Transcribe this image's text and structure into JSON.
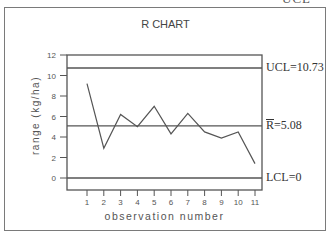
{
  "page": {
    "cut_text_top": "UCL"
  },
  "chart_data": {
    "type": "line",
    "title": "R CHART",
    "xlabel": "observation number",
    "ylabel": "range (kg/ha)",
    "x": [
      1,
      2,
      3,
      4,
      5,
      6,
      7,
      8,
      9,
      10,
      11
    ],
    "values": [
      9.2,
      2.9,
      6.2,
      5.0,
      7.0,
      4.3,
      6.3,
      4.5,
      3.9,
      4.5,
      1.4
    ],
    "series": [
      {
        "name": "range",
        "values": [
          9.2,
          2.9,
          6.2,
          5.0,
          7.0,
          4.3,
          6.3,
          4.5,
          3.9,
          4.5,
          1.4
        ]
      }
    ],
    "xticks": [
      "1",
      "2",
      "3",
      "4",
      "5",
      "6",
      "7",
      "8",
      "9",
      "10",
      "11"
    ],
    "yticks": [
      "0",
      "2",
      "4",
      "6",
      "8",
      "10",
      "12"
    ],
    "ylim": [
      -1,
      12
    ],
    "xlim": [
      0,
      11.4
    ],
    "grid": false,
    "control_lines": [
      {
        "name": "UCL",
        "value": 10.73,
        "label": "UCL=10.73"
      },
      {
        "name": "R-bar",
        "value": 5.08,
        "label_symbol": "R",
        "label_rest": "=5.08"
      },
      {
        "name": "LCL",
        "value": 0,
        "label": "LCL=0"
      }
    ],
    "colors": {
      "line": "#555555",
      "axis": "#555555",
      "control": "#555555"
    }
  }
}
